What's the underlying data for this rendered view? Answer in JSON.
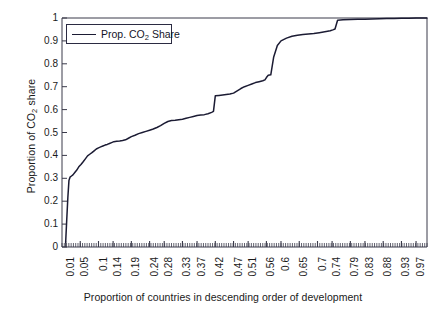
{
  "chart_data": {
    "type": "line",
    "title": "",
    "xlabel": "Proportion of countries in descending order of development",
    "ylabel_parts": {
      "pre": "Proportion of CO",
      "sub": "2",
      "post": " share"
    },
    "ylabel": "Proportion of CO2 share",
    "xlim": [
      0,
      1
    ],
    "ylim": [
      0,
      1
    ],
    "grid": false,
    "legend_position": "top-left",
    "legend": [
      {
        "label_pre": "Prop. CO",
        "label_sub": "2",
        "label_post": " Share",
        "label": "Prop. CO2 Share",
        "color": "#1b1b33"
      }
    ],
    "yticks": [
      "0",
      "0.1",
      "0.2",
      "0.3",
      "0.4",
      "0.5",
      "0.6",
      "0.7",
      "0.8",
      "0.9",
      "1"
    ],
    "ytick_values": [
      0,
      0.1,
      0.2,
      0.3,
      0.4,
      0.5,
      0.6,
      0.7,
      0.8,
      0.9,
      1
    ],
    "xticks": [
      "0.01",
      "0.05",
      "0.1",
      "0.14",
      "0.19",
      "0.24",
      "0.28",
      "0.33",
      "0.37",
      "0.42",
      "0.47",
      "0.51",
      "0.56",
      "0.6",
      "0.65",
      "0.7",
      "0.74",
      "0.79",
      "0.83",
      "0.88",
      "0.93",
      "0.97"
    ],
    "xtick_values": [
      0.01,
      0.05,
      0.1,
      0.14,
      0.19,
      0.24,
      0.28,
      0.33,
      0.37,
      0.42,
      0.47,
      0.51,
      0.56,
      0.6,
      0.65,
      0.7,
      0.74,
      0.79,
      0.83,
      0.88,
      0.93,
      0.97
    ],
    "series": [
      {
        "name": "Prop. CO2 Share",
        "color": "#1b1b33",
        "x": [
          0.01,
          0.013,
          0.016,
          0.019,
          0.022,
          0.026,
          0.03,
          0.035,
          0.04,
          0.046,
          0.052,
          0.058,
          0.064,
          0.07,
          0.076,
          0.082,
          0.088,
          0.094,
          0.1,
          0.106,
          0.112,
          0.118,
          0.124,
          0.13,
          0.136,
          0.142,
          0.15,
          0.158,
          0.166,
          0.174,
          0.182,
          0.19,
          0.2,
          0.21,
          0.22,
          0.23,
          0.24,
          0.25,
          0.26,
          0.27,
          0.28,
          0.29,
          0.3,
          0.31,
          0.32,
          0.33,
          0.34,
          0.35,
          0.36,
          0.37,
          0.38,
          0.39,
          0.4,
          0.41,
          0.415,
          0.42,
          0.43,
          0.44,
          0.45,
          0.46,
          0.47,
          0.48,
          0.49,
          0.5,
          0.51,
          0.52,
          0.53,
          0.54,
          0.55,
          0.556,
          0.56,
          0.565,
          0.572,
          0.58,
          0.59,
          0.6,
          0.615,
          0.63,
          0.645,
          0.66,
          0.675,
          0.69,
          0.705,
          0.72,
          0.735,
          0.742,
          0.748,
          0.755,
          0.77,
          0.79,
          0.81,
          0.83,
          0.85,
          0.87,
          0.89,
          0.91,
          0.93,
          0.95,
          0.97,
          0.99,
          1.0
        ],
        "y": [
          0.02,
          0.12,
          0.215,
          0.29,
          0.305,
          0.31,
          0.315,
          0.325,
          0.335,
          0.35,
          0.36,
          0.372,
          0.385,
          0.398,
          0.405,
          0.412,
          0.42,
          0.428,
          0.433,
          0.437,
          0.441,
          0.445,
          0.448,
          0.452,
          0.456,
          0.46,
          0.462,
          0.463,
          0.465,
          0.468,
          0.475,
          0.482,
          0.488,
          0.495,
          0.5,
          0.505,
          0.51,
          0.515,
          0.522,
          0.53,
          0.54,
          0.548,
          0.552,
          0.553,
          0.556,
          0.558,
          0.562,
          0.566,
          0.57,
          0.574,
          0.576,
          0.578,
          0.582,
          0.588,
          0.592,
          0.66,
          0.662,
          0.664,
          0.666,
          0.668,
          0.672,
          0.682,
          0.692,
          0.7,
          0.706,
          0.712,
          0.718,
          0.722,
          0.726,
          0.73,
          0.74,
          0.75,
          0.752,
          0.83,
          0.88,
          0.9,
          0.912,
          0.92,
          0.925,
          0.928,
          0.93,
          0.932,
          0.936,
          0.94,
          0.944,
          0.948,
          0.952,
          0.99,
          0.992,
          0.993,
          0.994,
          0.995,
          0.996,
          0.997,
          0.998,
          0.998,
          0.999,
          0.999,
          1.0,
          1.0,
          1.0
        ]
      }
    ]
  },
  "axes": {
    "plot_left_px": 62,
    "plot_top_px": 18,
    "plot_right_px": 427,
    "plot_bottom_px": 247,
    "axis_color": "#3a3a4a",
    "background": "#ffffff"
  }
}
